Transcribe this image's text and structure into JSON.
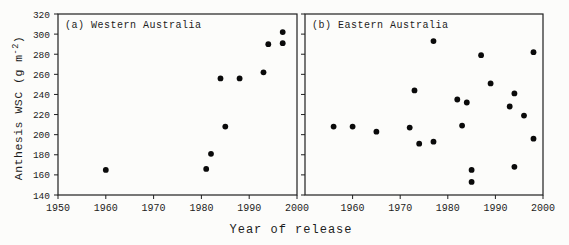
{
  "figure": {
    "xlabel": "Year of release",
    "ylabel": "Anthesis WSC (g m⁻²)",
    "ylabel_parts": {
      "prefix": "Anthesis WSC (g m",
      "superscript": "-2",
      "suffix": ")"
    },
    "background": "#fcfcfa",
    "axis_color": "#1f1f1f",
    "point_color": "#0a0a0a"
  },
  "chart_data": [
    {
      "type": "scatter",
      "panel": "a",
      "title": "(a) Western Australia",
      "xlabel": "Year of release",
      "ylabel": "Anthesis WSC (g m⁻²)",
      "xlim": [
        1950,
        2000
      ],
      "ylim": [
        140,
        320
      ],
      "grid": false,
      "legend": "none",
      "xticks": [
        1950,
        1960,
        1970,
        1980,
        1990,
        2000
      ],
      "xtick_labels": [
        "1950",
        "1960",
        "1970",
        "1980",
        "1990",
        "2000"
      ],
      "yticks": [
        140,
        160,
        180,
        200,
        220,
        240,
        260,
        280,
        300,
        320
      ],
      "ytick_labels": [
        "140",
        "160",
        "180",
        "200",
        "220",
        "240",
        "260",
        "280",
        "300",
        "320"
      ],
      "points": [
        [
          1960,
          165
        ],
        [
          1981,
          166
        ],
        [
          1982,
          181
        ],
        [
          1984,
          256
        ],
        [
          1985,
          208
        ],
        [
          1988,
          256
        ],
        [
          1993,
          262
        ],
        [
          1994,
          290
        ],
        [
          1997,
          302
        ],
        [
          1997,
          291
        ]
      ]
    },
    {
      "type": "scatter",
      "panel": "b",
      "title": "(b) Eastern Australia",
      "xlabel": "Year of release",
      "ylabel": "Anthesis WSC (g m⁻²)",
      "xlim": [
        1950,
        2000
      ],
      "ylim": [
        140,
        320
      ],
      "grid": false,
      "legend": "none",
      "xticks": [
        1960,
        1970,
        1980,
        1990,
        2000
      ],
      "xtick_labels": [
        "1960",
        "1970",
        "1980",
        "1990",
        "2000"
      ],
      "yticks": [
        140,
        160,
        180,
        200,
        220,
        240,
        260,
        280,
        300,
        320
      ],
      "ytick_labels": [],
      "points": [
        [
          1956,
          208
        ],
        [
          1960,
          208
        ],
        [
          1965,
          203
        ],
        [
          1972,
          207
        ],
        [
          1973,
          244
        ],
        [
          1974,
          191
        ],
        [
          1977,
          193
        ],
        [
          1977,
          293
        ],
        [
          1982,
          235
        ],
        [
          1983,
          209
        ],
        [
          1984,
          232
        ],
        [
          1985,
          165
        ],
        [
          1985,
          153
        ],
        [
          1987,
          279
        ],
        [
          1989,
          251
        ],
        [
          1993,
          228
        ],
        [
          1994,
          241
        ],
        [
          1994,
          168
        ],
        [
          1996,
          219
        ],
        [
          1998,
          282
        ],
        [
          1998,
          196
        ]
      ]
    }
  ]
}
